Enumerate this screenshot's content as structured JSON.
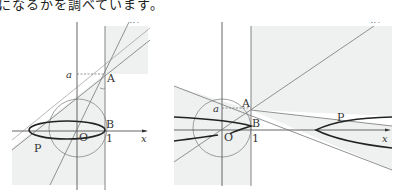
{
  "caption": "になるかを調べています。",
  "figures": [
    {
      "id": "left",
      "labels": {
        "z_axis": "z",
        "x_axis": "x",
        "axis": "軸",
        "a": "a",
        "A": "A",
        "B": "B",
        "O": "O",
        "one": "1",
        "P": "P"
      },
      "curve": "ellipse"
    },
    {
      "id": "right",
      "labels": {
        "z_axis": "z",
        "x_axis": "x",
        "axis": "軸",
        "a": "a",
        "A": "A",
        "B": "B",
        "O": "O",
        "one": "1",
        "P": "P"
      },
      "curve": "hyperbola"
    }
  ],
  "colors": {
    "shade": "#eef1f0",
    "line": "#777777",
    "curve": "#222222",
    "text": "#333333"
  }
}
